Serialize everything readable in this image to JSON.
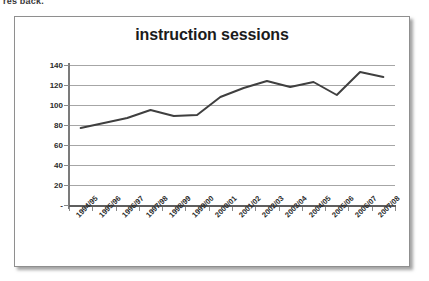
{
  "page_fragment": "res back.",
  "chart_frame": {
    "border_color": "#8f8f8f",
    "background_color": "#ffffff"
  },
  "chart_data": {
    "type": "line",
    "title": "instruction sessions",
    "xlabel": "",
    "ylabel": "",
    "categories": [
      "1994/95",
      "1995/96",
      "1996/97",
      "1997/98",
      "1998/99",
      "1999/00",
      "2000/01",
      "2001/02",
      "2002/03",
      "2003/04",
      "2004/05",
      "2005/06",
      "2006/07",
      "2007/08"
    ],
    "values": [
      77,
      82,
      87,
      95,
      89,
      90,
      108,
      117,
      124,
      118,
      123,
      110,
      133,
      128
    ],
    "series": [
      {
        "name": "instruction sessions",
        "color": "#3f3f3f",
        "values": [
          77,
          82,
          87,
          95,
          89,
          90,
          108,
          117,
          124,
          118,
          123,
          110,
          133,
          128
        ]
      }
    ],
    "ylim": [
      0,
      140
    ],
    "y_ticks": [
      0,
      20,
      40,
      60,
      80,
      100,
      120,
      140
    ],
    "y_tick_labels": [
      "-",
      "20",
      "40",
      "60",
      "80",
      "100",
      "120",
      "140"
    ],
    "grid": true,
    "grid_color": "#a6a6a6",
    "legend": "none",
    "line_color": "#3f3f3f",
    "line_width": 2
  }
}
